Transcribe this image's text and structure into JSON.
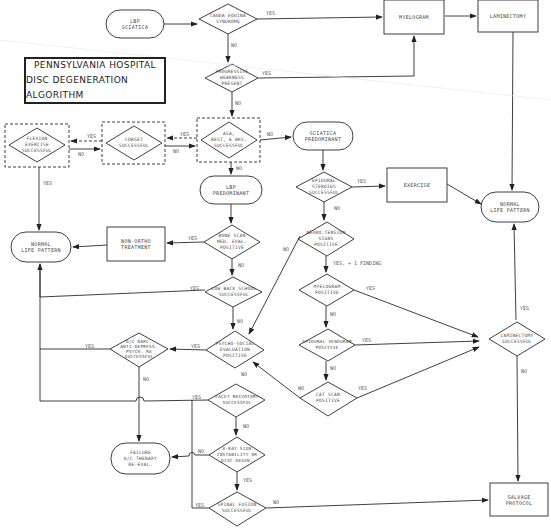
{
  "title": {
    "line1": "PENNSYLVANIA HOSPITAL",
    "line2": "DISC DEGENERATION ALGORITHM"
  },
  "nodes": {
    "lbp_sciatica": "LBP\nSciatica",
    "cauda_equina": "Cauda equina\nsyndrome",
    "myelogram_top": "Myelogram",
    "laminectomy_top": "Laminectomy",
    "progressive_weakness": "Progressive\nweakness\npresent",
    "flexion_exercise": "Flexion\nexercise\nsuccessful",
    "corset": "Corset\nsuccessful",
    "asa_rest": "ASA,\nrest, 6 wks.\nsuccessful",
    "sciatica_predominant": "Sciatica\npredominant",
    "lbp_predominant": "LBP\nPredominant",
    "epidural_steroids": "Epidural\nsteroids\nsuccessful",
    "exercise": "Exercise",
    "normal_life_right": "Normal\nlife pattern",
    "normal_life_left": "Normal\nlife pattern",
    "non_ortho": "Non-ortho\ntreatment",
    "bone_scan": "Bone scan\nmed. eval.\npositive",
    "neuro_tension": "Neuro.tension\nsigns\npositive",
    "low_back_school": "Low back school\nsuccessful",
    "myelogram_positive": "Myelogram\npositive",
    "laminectomy_successful": "Laminectomy\nsuccessful",
    "dc_narc": "D/C Narc.\nanti-depress.\npsych. Rx\nsuccessful",
    "psycho_social": "Psycho-social\nevaluation\npositive",
    "epidural_venogram": "Epidural venogram\npositive",
    "cat_scan": "CAT scan\npositive",
    "facet_rhizotomy": "Facet rhizotomy\nsuccessful",
    "failure": "Failure\nD/C therapy\nre-eval.",
    "xray_signs": "X-ray sign\ninstability or\ndisc degen.",
    "spinal_fusion": "Spinal fusion\nsuccessful",
    "salvage": "Salvage\nprotocol"
  },
  "labels": {
    "yes": "Yes",
    "no": "No",
    "yes_finding": "Yes, + 1 finding"
  },
  "colors": {
    "ink": "#2a2a2a",
    "text": "#444444",
    "background": "#ffffff"
  }
}
